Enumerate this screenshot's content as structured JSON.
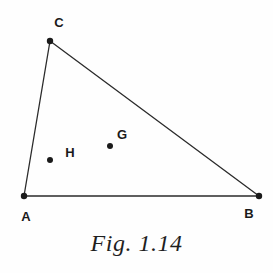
{
  "figure": {
    "caption": "Fig. 1.14",
    "type": "geometry-diagram",
    "background_color": "#fefefe",
    "stroke_color": "#2b2b2b",
    "label_color": "#1a1a1a",
    "canvas": {
      "width": 273,
      "height": 273
    }
  },
  "vertices": [
    {
      "id": "A",
      "label": "A",
      "x": 24,
      "y": 196,
      "label_x": 26,
      "label_y": 216,
      "dot_r": 3.2
    },
    {
      "id": "B",
      "label": "B",
      "x": 259,
      "y": 196,
      "label_x": 249,
      "label_y": 213,
      "dot_r": 3.2
    },
    {
      "id": "C",
      "label": "C",
      "x": 50,
      "y": 41,
      "label_x": 59,
      "label_y": 22,
      "dot_r": 3.2
    }
  ],
  "interior_points": [
    {
      "id": "H",
      "label": "H",
      "x": 50,
      "y": 160,
      "label_x": 70,
      "label_y": 152,
      "dot_r": 3.0
    },
    {
      "id": "G",
      "label": "G",
      "x": 110,
      "y": 146,
      "label_x": 122,
      "label_y": 134,
      "dot_r": 3.0
    }
  ],
  "edges": [
    {
      "id": "AB",
      "from": "A",
      "to": "B",
      "x1": 24,
      "y1": 196,
      "x2": 259,
      "y2": 196,
      "width": 1.6
    },
    {
      "id": "AC",
      "from": "A",
      "to": "C",
      "x1": 24,
      "y1": 196,
      "x2": 50,
      "y2": 41,
      "width": 1.3
    },
    {
      "id": "CB",
      "from": "C",
      "to": "B",
      "x1": 50,
      "y1": 41,
      "x2": 259,
      "y2": 196,
      "width": 1.3
    }
  ]
}
